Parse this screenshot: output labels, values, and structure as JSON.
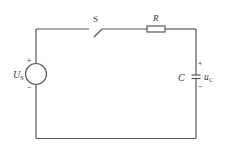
{
  "diagram": {
    "type": "RC circuit",
    "components": {
      "source": {
        "label_main": "U",
        "label_sub": "S",
        "plus": "+",
        "minus": "−"
      },
      "switch": {
        "label": "S"
      },
      "resistor": {
        "label": "R"
      },
      "capacitor": {
        "label": "C",
        "voltage_main": "u",
        "voltage_sub": "C",
        "plus": "+",
        "minus": "−"
      }
    },
    "colors": {
      "wire": "#555555",
      "text": "#333333",
      "background": "#ffffff"
    }
  }
}
